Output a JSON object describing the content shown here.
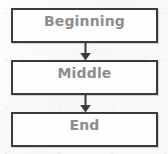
{
  "diagram": {
    "title": "",
    "type": "flowchart",
    "orientation": "vertical",
    "background_color": "#fbfbfa",
    "border_color": "#3b3b3b",
    "text_color": "#8d8d8d",
    "nodes": [
      {
        "id": "beginning",
        "label": "Beginning"
      },
      {
        "id": "middle",
        "label": "Middle"
      },
      {
        "id": "end",
        "label": "End"
      }
    ],
    "connectors": [
      {
        "id": "beginning-to-middle",
        "icon": "down-arrow-icon",
        "from": "beginning",
        "to": "middle"
      },
      {
        "id": "middle-to-end",
        "icon": "down-arrow-icon",
        "from": "middle",
        "to": "end"
      }
    ]
  }
}
